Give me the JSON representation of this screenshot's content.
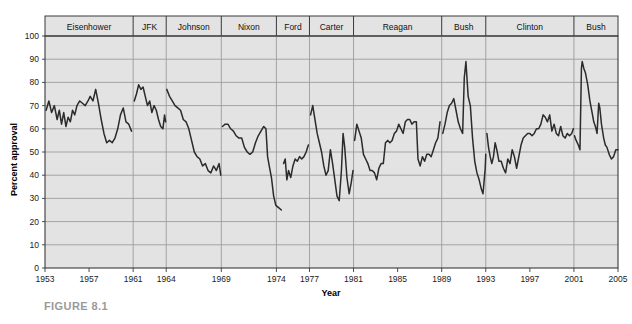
{
  "figure": {
    "caption": "FIGURE 8.1"
  },
  "chart_data": {
    "type": "line",
    "title": "",
    "xlabel": "Year",
    "ylabel": "Percent approval",
    "xlim": [
      1953,
      2005
    ],
    "ylim": [
      0,
      100
    ],
    "grid": true,
    "legend": "none",
    "y_ticks": [
      0,
      10,
      20,
      30,
      40,
      50,
      60,
      70,
      80,
      90,
      100
    ],
    "x_ticks": [
      1953,
      1957,
      1961,
      1964,
      1969,
      1974,
      1977,
      1981,
      1985,
      1989,
      1993,
      1997,
      2001,
      2005
    ],
    "series_name": "Presidential approval",
    "line_color": "#2b2b2b",
    "plot_background": "#e3e3e3",
    "grid_color": "#9c9c9c",
    "administrations": [
      {
        "label": "Eisenhower",
        "start": 1953,
        "end": 1961
      },
      {
        "label": "JFK",
        "start": 1961,
        "end": 1964
      },
      {
        "label": "Johnson",
        "start": 1964,
        "end": 1969
      },
      {
        "label": "Nixon",
        "start": 1969,
        "end": 1974
      },
      {
        "label": "Ford",
        "start": 1974,
        "end": 1977
      },
      {
        "label": "Carter",
        "start": 1977,
        "end": 1981
      },
      {
        "label": "Reagan",
        "start": 1981,
        "end": 1989
      },
      {
        "label": "Bush",
        "start": 1989,
        "end": 1993
      },
      {
        "label": "Clinton",
        "start": 1993,
        "end": 2001
      },
      {
        "label": "Bush",
        "start": 2001,
        "end": 2005
      }
    ],
    "segments": [
      {
        "administration": "Eisenhower",
        "points": [
          [
            1953.1,
            68
          ],
          [
            1953.35,
            72
          ],
          [
            1953.6,
            67
          ],
          [
            1953.85,
            70
          ],
          [
            1954.1,
            64
          ],
          [
            1954.3,
            68
          ],
          [
            1954.5,
            62
          ],
          [
            1954.7,
            67
          ],
          [
            1954.9,
            61
          ],
          [
            1955.1,
            65
          ],
          [
            1955.3,
            63
          ],
          [
            1955.5,
            68
          ],
          [
            1955.7,
            66
          ],
          [
            1955.9,
            70
          ],
          [
            1956.15,
            72
          ],
          [
            1956.4,
            71
          ],
          [
            1956.65,
            70
          ],
          [
            1956.9,
            72
          ],
          [
            1957.1,
            74
          ],
          [
            1957.35,
            72
          ],
          [
            1957.6,
            77
          ],
          [
            1957.85,
            71
          ],
          [
            1958.1,
            64
          ],
          [
            1958.35,
            58
          ],
          [
            1958.6,
            54
          ],
          [
            1958.85,
            55
          ],
          [
            1959.1,
            54
          ],
          [
            1959.35,
            56
          ],
          [
            1959.6,
            60
          ],
          [
            1959.85,
            66
          ],
          [
            1960.1,
            69
          ],
          [
            1960.35,
            63
          ],
          [
            1960.6,
            62
          ],
          [
            1960.85,
            59
          ]
        ]
      },
      {
        "administration": "JFK",
        "points": [
          [
            1961.1,
            72
          ],
          [
            1961.3,
            75
          ],
          [
            1961.5,
            79
          ],
          [
            1961.7,
            77
          ],
          [
            1961.9,
            78
          ],
          [
            1962.1,
            74
          ],
          [
            1962.3,
            70
          ],
          [
            1962.5,
            72
          ],
          [
            1962.7,
            67
          ],
          [
            1962.9,
            70
          ],
          [
            1963.1,
            68
          ],
          [
            1963.3,
            64
          ],
          [
            1963.5,
            61
          ],
          [
            1963.7,
            60
          ],
          [
            1963.85,
            66
          ],
          [
            1963.95,
            63
          ]
        ]
      },
      {
        "administration": "Johnson",
        "points": [
          [
            1964.05,
            77
          ],
          [
            1964.3,
            74
          ],
          [
            1964.55,
            72
          ],
          [
            1964.8,
            70
          ],
          [
            1965.05,
            69
          ],
          [
            1965.3,
            68
          ],
          [
            1965.55,
            64
          ],
          [
            1965.8,
            63
          ],
          [
            1966.05,
            60
          ],
          [
            1966.3,
            55
          ],
          [
            1966.55,
            50
          ],
          [
            1966.8,
            48
          ],
          [
            1967.05,
            47
          ],
          [
            1967.3,
            44
          ],
          [
            1967.55,
            45
          ],
          [
            1967.8,
            42
          ],
          [
            1968.05,
            41
          ],
          [
            1968.3,
            44
          ],
          [
            1968.55,
            42
          ],
          [
            1968.8,
            45
          ],
          [
            1968.95,
            40
          ]
        ]
      },
      {
        "administration": "Nixon",
        "points": [
          [
            1969.1,
            61
          ],
          [
            1969.35,
            62
          ],
          [
            1969.6,
            62
          ],
          [
            1969.85,
            60
          ],
          [
            1970.1,
            59
          ],
          [
            1970.35,
            57
          ],
          [
            1970.6,
            56
          ],
          [
            1970.85,
            56
          ],
          [
            1971.1,
            52
          ],
          [
            1971.35,
            50
          ],
          [
            1971.6,
            49
          ],
          [
            1971.85,
            50
          ],
          [
            1972.1,
            54
          ],
          [
            1972.35,
            57
          ],
          [
            1972.6,
            59
          ],
          [
            1972.85,
            61
          ],
          [
            1973.05,
            60
          ],
          [
            1973.2,
            48
          ],
          [
            1973.35,
            44
          ],
          [
            1973.55,
            39
          ],
          [
            1973.75,
            31
          ],
          [
            1973.95,
            27
          ],
          [
            1974.2,
            26
          ],
          [
            1974.45,
            25
          ]
        ]
      },
      {
        "administration": "Ford",
        "points": [
          [
            1974.65,
            45
          ],
          [
            1974.8,
            47
          ],
          [
            1974.95,
            38
          ],
          [
            1975.1,
            42
          ],
          [
            1975.3,
            39
          ],
          [
            1975.5,
            44
          ],
          [
            1975.7,
            47
          ],
          [
            1975.9,
            46
          ],
          [
            1976.1,
            48
          ],
          [
            1976.3,
            47
          ],
          [
            1976.5,
            48
          ],
          [
            1976.7,
            50
          ],
          [
            1976.9,
            53
          ]
        ]
      },
      {
        "administration": "Carter",
        "points": [
          [
            1977.1,
            66
          ],
          [
            1977.3,
            70
          ],
          [
            1977.5,
            64
          ],
          [
            1977.7,
            58
          ],
          [
            1977.9,
            54
          ],
          [
            1978.1,
            50
          ],
          [
            1978.3,
            44
          ],
          [
            1978.5,
            40
          ],
          [
            1978.7,
            42
          ],
          [
            1978.9,
            51
          ],
          [
            1979.1,
            45
          ],
          [
            1979.3,
            38
          ],
          [
            1979.5,
            31
          ],
          [
            1979.7,
            29
          ],
          [
            1979.9,
            42
          ],
          [
            1980.05,
            58
          ],
          [
            1980.2,
            52
          ],
          [
            1980.4,
            39
          ],
          [
            1980.6,
            32
          ],
          [
            1980.8,
            37
          ],
          [
            1980.95,
            42
          ]
        ]
      },
      {
        "administration": "Reagan",
        "points": [
          [
            1981.1,
            55
          ],
          [
            1981.3,
            62
          ],
          [
            1981.5,
            59
          ],
          [
            1981.7,
            56
          ],
          [
            1981.9,
            49
          ],
          [
            1982.1,
            47
          ],
          [
            1982.3,
            45
          ],
          [
            1982.5,
            42
          ],
          [
            1982.7,
            42
          ],
          [
            1982.9,
            41
          ],
          [
            1983.1,
            38
          ],
          [
            1983.3,
            43
          ],
          [
            1983.5,
            45
          ],
          [
            1983.7,
            45
          ],
          [
            1983.9,
            54
          ],
          [
            1984.1,
            55
          ],
          [
            1984.3,
            54
          ],
          [
            1984.5,
            55
          ],
          [
            1984.7,
            58
          ],
          [
            1984.9,
            59
          ],
          [
            1985.1,
            62
          ],
          [
            1985.3,
            60
          ],
          [
            1985.5,
            58
          ],
          [
            1985.7,
            63
          ],
          [
            1985.9,
            64
          ],
          [
            1986.1,
            64
          ],
          [
            1986.3,
            62
          ],
          [
            1986.5,
            63
          ],
          [
            1986.7,
            63
          ],
          [
            1986.85,
            47
          ],
          [
            1987.05,
            44
          ],
          [
            1987.25,
            48
          ],
          [
            1987.45,
            46
          ],
          [
            1987.65,
            49
          ],
          [
            1987.85,
            49
          ],
          [
            1988.05,
            48
          ],
          [
            1988.25,
            51
          ],
          [
            1988.45,
            54
          ],
          [
            1988.65,
            56
          ],
          [
            1988.85,
            63
          ]
        ]
      },
      {
        "administration": "Bush",
        "points": [
          [
            1989.1,
            58
          ],
          [
            1989.3,
            62
          ],
          [
            1989.5,
            67
          ],
          [
            1989.7,
            70
          ],
          [
            1989.9,
            71
          ],
          [
            1990.1,
            73
          ],
          [
            1990.3,
            68
          ],
          [
            1990.5,
            63
          ],
          [
            1990.7,
            60
          ],
          [
            1990.9,
            58
          ],
          [
            1991.05,
            82
          ],
          [
            1991.2,
            89
          ],
          [
            1991.4,
            74
          ],
          [
            1991.6,
            70
          ],
          [
            1991.8,
            56
          ],
          [
            1992.0,
            46
          ],
          [
            1992.2,
            41
          ],
          [
            1992.4,
            38
          ],
          [
            1992.6,
            34
          ],
          [
            1992.75,
            32
          ],
          [
            1992.95,
            43
          ],
          [
            1993.0,
            49
          ]
        ]
      },
      {
        "administration": "Clinton",
        "points": [
          [
            1993.1,
            58
          ],
          [
            1993.25,
            52
          ],
          [
            1993.4,
            48
          ],
          [
            1993.55,
            45
          ],
          [
            1993.7,
            48
          ],
          [
            1993.85,
            54
          ],
          [
            1994.0,
            51
          ],
          [
            1994.2,
            46
          ],
          [
            1994.4,
            46
          ],
          [
            1994.6,
            43
          ],
          [
            1994.8,
            41
          ],
          [
            1995.0,
            47
          ],
          [
            1995.2,
            45
          ],
          [
            1995.4,
            51
          ],
          [
            1995.6,
            48
          ],
          [
            1995.8,
            43
          ],
          [
            1996.0,
            48
          ],
          [
            1996.2,
            53
          ],
          [
            1996.4,
            56
          ],
          [
            1996.6,
            57
          ],
          [
            1996.8,
            58
          ],
          [
            1997.0,
            58
          ],
          [
            1997.2,
            57
          ],
          [
            1997.4,
            58
          ],
          [
            1997.6,
            60
          ],
          [
            1997.8,
            60
          ],
          [
            1998.0,
            62
          ],
          [
            1998.2,
            66
          ],
          [
            1998.4,
            65
          ],
          [
            1998.6,
            63
          ],
          [
            1998.8,
            66
          ],
          [
            1999.0,
            59
          ],
          [
            1999.2,
            62
          ],
          [
            1999.4,
            58
          ],
          [
            1999.6,
            57
          ],
          [
            1999.8,
            61
          ],
          [
            2000.0,
            57
          ],
          [
            2000.2,
            56
          ],
          [
            2000.4,
            58
          ],
          [
            2000.6,
            57
          ],
          [
            2000.8,
            58
          ],
          [
            2000.95,
            60
          ]
        ]
      },
      {
        "administration": "Bush",
        "points": [
          [
            2001.05,
            57
          ],
          [
            2001.2,
            55
          ],
          [
            2001.4,
            53
          ],
          [
            2001.55,
            51
          ],
          [
            2001.68,
            86
          ],
          [
            2001.75,
            89
          ],
          [
            2001.9,
            86
          ],
          [
            2002.05,
            84
          ],
          [
            2002.25,
            79
          ],
          [
            2002.45,
            72
          ],
          [
            2002.65,
            67
          ],
          [
            2002.8,
            63
          ],
          [
            2002.95,
            61
          ],
          [
            2003.1,
            58
          ],
          [
            2003.25,
            71
          ],
          [
            2003.35,
            69
          ],
          [
            2003.5,
            62
          ],
          [
            2003.7,
            56
          ],
          [
            2003.85,
            53
          ],
          [
            2004.0,
            52
          ],
          [
            2004.2,
            49
          ],
          [
            2004.4,
            47
          ],
          [
            2004.6,
            48
          ],
          [
            2004.8,
            51
          ],
          [
            2005.0,
            51
          ]
        ]
      }
    ]
  }
}
